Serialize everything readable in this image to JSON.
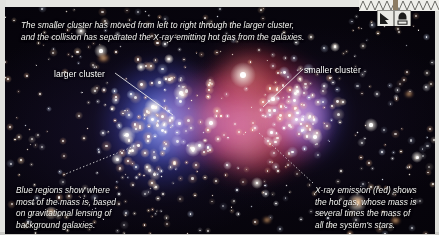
{
  "figure": {
    "title_caption": "The smaller cluster has moved from left to right through the larger cluster,\nand the collision has separated the X-ray-emitting hot gas from the galaxies.",
    "labels": {
      "larger_cluster": "larger cluster",
      "smaller_cluster": "smaller cluster"
    },
    "captions": {
      "bottom_left": "Blue regions show where\nmost of the mass is, based\non gravitational lensing of\nbackground galaxies.",
      "bottom_right": "X-ray emission (red) shows\nthe hot gas, whose mass is\nseveral times the mass of\nall the system's stars."
    },
    "colors": {
      "xray_red": "#e53e3e",
      "mass_blue": "#566ce0",
      "space_black": "#05030a",
      "annotation_text": "#ffffff",
      "paper_margin": "#e2e2de"
    },
    "icons": {
      "zigzag": "zigzag-artifact-icon",
      "box_one": "scan-marker-icon",
      "box_two": "scan-marker-icon"
    }
  }
}
